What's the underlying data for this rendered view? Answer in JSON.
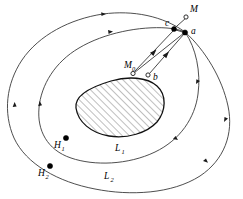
{
  "figure": {
    "type": "phase-portrait-diagram",
    "background_color": "#ffffff",
    "stroke_color": "#3a3a3a",
    "hatch_color": "#555555"
  },
  "labels": {
    "M": "M",
    "M0": "M",
    "M0_sub": "0",
    "a": "a",
    "b": "b",
    "c": "c",
    "H1": "H",
    "H1_sub": "1",
    "H2": "H",
    "H2_sub": "2",
    "L1": "L",
    "L1_sub": "1",
    "L2": "L",
    "L2_sub": "2"
  },
  "points": [
    {
      "name": "M",
      "style": "open",
      "x": 186,
      "y": 17
    },
    {
      "name": "c",
      "style": "filled",
      "x": 174,
      "y": 29
    },
    {
      "name": "a",
      "style": "filled",
      "x": 185,
      "y": 32
    },
    {
      "name": "M0",
      "style": "open",
      "x": 133,
      "y": 73
    },
    {
      "name": "b",
      "style": "open",
      "x": 148,
      "y": 75
    },
    {
      "name": "H1",
      "style": "filled",
      "x": 66,
      "y": 138
    },
    {
      "name": "H2",
      "style": "filled",
      "x": 50,
      "y": 166
    }
  ],
  "curves": [
    {
      "name": "L1",
      "kind": "closed-orbit",
      "arrows": 4
    },
    {
      "name": "L2",
      "kind": "closed-orbit",
      "arrows": 4
    }
  ],
  "segments": [
    {
      "from": "M0",
      "to": "c",
      "arrow": true
    },
    {
      "from": "b",
      "to": "a",
      "arrow": true
    },
    {
      "from": "a",
      "to": "M0",
      "arrow": false
    },
    {
      "from": "c",
      "to": "a",
      "arrow": false
    }
  ],
  "hatched_region": {
    "name": "invariant-set",
    "pattern": "diagonal-lines",
    "angle_deg": 45
  }
}
